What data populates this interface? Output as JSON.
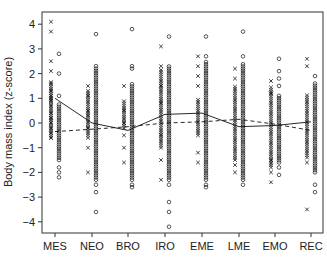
{
  "chart_data": {
    "type": "scatter",
    "title": "",
    "xlabel": "",
    "ylabel": "Body mass index (z-score)",
    "ylim": [
      -4.4,
      4.4
    ],
    "yticks": [
      -4,
      -3,
      -2,
      -1,
      0,
      1,
      2,
      3,
      4
    ],
    "ytick_labels": [
      "−4",
      "−3",
      "−2",
      "−1",
      "0",
      "1",
      "2",
      "3",
      "4"
    ],
    "categories": [
      "MES",
      "NEO",
      "BRO",
      "IRO",
      "EME",
      "LME",
      "EMO",
      "REC"
    ],
    "grid": false,
    "legend": null,
    "point_series": [
      {
        "name": "x markers",
        "marker": "x",
        "offset": -4,
        "groups": [
          {
            "category": "MES",
            "dense_range": [
              -0.6,
              1.7
            ],
            "points": [
              4.1,
              3.7,
              2.5,
              2.1,
              1.6,
              1.3,
              1.1,
              1.0,
              0.9,
              0.7,
              0.4,
              0.2,
              0.0,
              -0.2,
              -0.4,
              -0.6
            ]
          },
          {
            "category": "NEO",
            "dense_range": [
              -0.5,
              1.3
            ],
            "points": [
              1.5,
              1.1,
              0.5,
              0.3,
              -0.2,
              -0.6,
              -1.0,
              -2.0
            ]
          },
          {
            "category": "BRO",
            "dense_range": [
              -0.2,
              0.9
            ],
            "points": [
              1.5,
              0.5,
              0.0,
              -0.5,
              -1.0,
              -1.6
            ]
          },
          {
            "category": "IRO",
            "dense_range": [
              -1.0,
              2.2
            ],
            "points": [
              3.1,
              2.3,
              1.5,
              0.8,
              -0.5,
              -1.5,
              -2.3
            ]
          },
          {
            "category": "EME",
            "dense_range": [
              -0.5,
              1.0
            ],
            "points": [
              2.7,
              2.3,
              1.9,
              1.5,
              -1.2,
              -1.6
            ]
          },
          {
            "category": "LME",
            "dense_range": [
              -1.5,
              1.5
            ],
            "points": [
              2.2,
              1.8,
              -1.7,
              -2.0
            ]
          },
          {
            "category": "EMO",
            "dense_range": [
              -1.8,
              1.5
            ],
            "points": [
              1.7,
              1.2,
              -1.5,
              -2.0,
              -2.4
            ]
          },
          {
            "category": "REC",
            "dense_range": [
              -1.4,
              1.2
            ],
            "points": [
              2.6,
              2.3,
              -1.6,
              -3.5
            ]
          }
        ]
      },
      {
        "name": "o markers",
        "marker": "o",
        "offset": 4,
        "groups": [
          {
            "category": "MES",
            "dense_range": [
              -1.5,
              0.8
            ],
            "points": [
              2.8,
              2.0,
              1.1,
              -1.8,
              -2.0,
              -2.2
            ]
          },
          {
            "category": "NEO",
            "dense_range": [
              -2.3,
              2.2
            ],
            "points": [
              3.6,
              2.3,
              -2.5,
              -2.8,
              -3.6
            ]
          },
          {
            "category": "BRO",
            "dense_range": [
              -2.3,
              1.6
            ],
            "points": [
              3.8,
              2.2,
              2.3,
              -2.5,
              -2.6
            ]
          },
          {
            "category": "IRO",
            "dense_range": [
              -2.3,
              2.3
            ],
            "points": [
              3.5,
              -2.5,
              -3.2,
              -3.6,
              -4.2
            ]
          },
          {
            "category": "EME",
            "dense_range": [
              -2.3,
              2.5
            ],
            "points": [
              3.5,
              2.7,
              -2.5,
              -2.6
            ]
          },
          {
            "category": "LME",
            "dense_range": [
              -2.3,
              2.4
            ],
            "points": [
              3.7,
              2.7,
              -2.5
            ]
          },
          {
            "category": "EMO",
            "dense_range": [
              -1.6,
              1.1
            ],
            "points": [
              2.6,
              2.1,
              1.8,
              1.5,
              -1.8,
              -2.1
            ]
          },
          {
            "category": "REC",
            "dense_range": [
              -2.0,
              1.6
            ],
            "points": [
              1.9,
              -2.5,
              -2.8
            ]
          }
        ]
      }
    ],
    "line_series": [
      {
        "name": "solid line",
        "style": "solid",
        "values": [
          1.0,
          0.0,
          -0.3,
          0.35,
          0.4,
          -0.15,
          -0.1,
          0.05
        ]
      },
      {
        "name": "dashed line",
        "style": "dashed",
        "values": [
          -0.35,
          -0.25,
          -0.15,
          0.0,
          0.05,
          0.15,
          -0.05,
          -0.3
        ]
      }
    ]
  }
}
